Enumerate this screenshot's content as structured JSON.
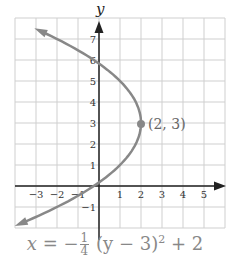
{
  "chart_data": {
    "type": "line",
    "title": "",
    "xlabel": "",
    "ylabel": "y",
    "xlim": [
      -4,
      6
    ],
    "ylim": [
      -2,
      8
    ],
    "grid": true,
    "x_ticks": [
      "−3",
      "−2",
      "−1",
      "1",
      "2",
      "3",
      "4",
      "5"
    ],
    "y_ticks": [
      "−1",
      "1",
      "2",
      "3",
      "4",
      "5",
      "6",
      "7"
    ],
    "series": [
      {
        "name": "x = −(1/4)(y − 3)^2 + 2",
        "color": "#888888",
        "y": [
          -1.8,
          -1,
          0,
          1,
          2,
          3,
          4,
          5,
          6,
          7.4
        ],
        "x": [
          -3.76,
          -2,
          -0.25,
          1,
          1.75,
          2,
          1.75,
          1,
          -0.25,
          -2.84
        ]
      }
    ],
    "annotations": [
      {
        "label": "(2, 3)",
        "x": 2,
        "y": 3,
        "type": "vertex-point"
      }
    ],
    "equation": {
      "lhs": "x",
      "eq": "=",
      "neg": "−",
      "frac_num": "1",
      "frac_den": "4",
      "body": "(y − 3)",
      "exp": "2",
      "tail": "+ 2"
    }
  },
  "labels": {
    "y_axis": "y",
    "vertex": "(2, 3)"
  }
}
